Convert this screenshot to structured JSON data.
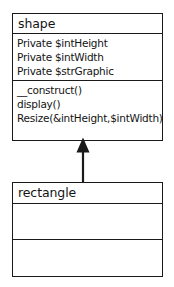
{
  "diagram": {
    "type": "uml-class-diagram",
    "background_color": "#ffffff",
    "line_color": "#1a1a1a",
    "text_color": "#141414",
    "classes": [
      {
        "id": "shape",
        "name": "shape",
        "attributes": [
          "Private $intHeight",
          "Private $intWidth",
          "Private $strGraphic"
        ],
        "methods": [
          "__construct()",
          "display()",
          "Resize(&intHeight,$intWidth)"
        ]
      },
      {
        "id": "rectangle",
        "name": "rectangle",
        "attributes": [],
        "methods": []
      }
    ],
    "relationships": [
      {
        "id": "generalization",
        "kind": "generalization",
        "label": "",
        "from": "rectangle",
        "to": "shape",
        "arrowhead": "closed-triangle"
      }
    ]
  }
}
